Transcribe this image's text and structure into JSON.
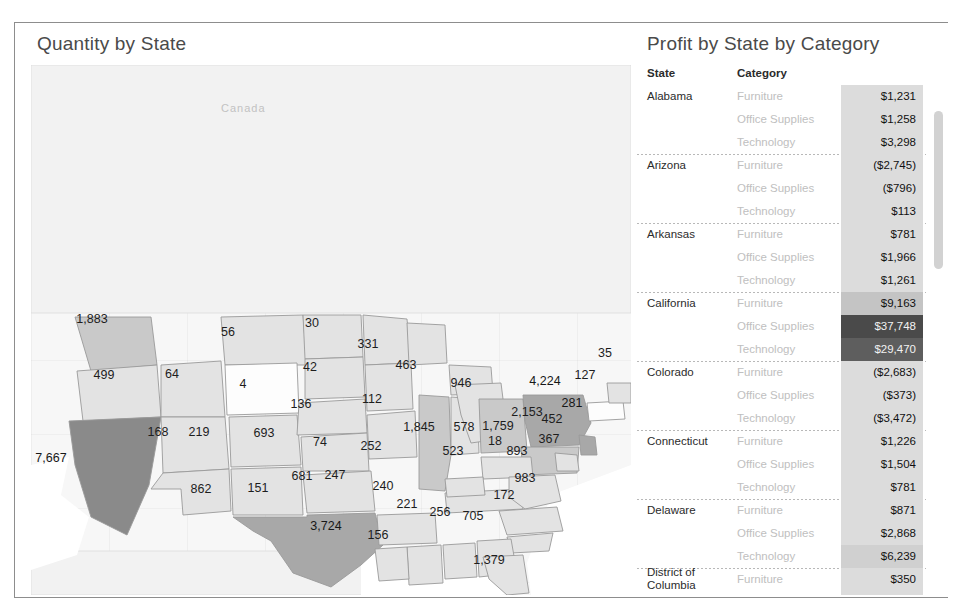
{
  "map_panel": {
    "title": "Quantity by State",
    "geo_labels": [
      {
        "name": "canada-label",
        "text": "Canada",
        "x": 190,
        "y": 75
      },
      {
        "name": "mexico-label",
        "text": "Mexico",
        "x": 280,
        "y": 585
      }
    ]
  },
  "table_panel": {
    "title": "Profit by State by Category",
    "headers": {
      "state": "State",
      "category": "Category"
    },
    "rows": [
      {
        "state": "Alabama",
        "category": "Furniture",
        "value": "$1,231",
        "shade": "light",
        "group_start": true,
        "first": true
      },
      {
        "state": "",
        "category": "Office Supplies",
        "value": "$1,258",
        "shade": "light"
      },
      {
        "state": "",
        "category": "Technology",
        "value": "$3,298",
        "shade": "light"
      },
      {
        "state": "Arizona",
        "category": "Furniture",
        "value": "($2,745)",
        "shade": "light",
        "group_start": true
      },
      {
        "state": "",
        "category": "Office Supplies",
        "value": "($796)",
        "shade": "light"
      },
      {
        "state": "",
        "category": "Technology",
        "value": "$113",
        "shade": "light"
      },
      {
        "state": "Arkansas",
        "category": "Furniture",
        "value": "$781",
        "shade": "light",
        "group_start": true
      },
      {
        "state": "",
        "category": "Office Supplies",
        "value": "$1,966",
        "shade": "light"
      },
      {
        "state": "",
        "category": "Technology",
        "value": "$1,261",
        "shade": "light"
      },
      {
        "state": "California",
        "category": "Furniture",
        "value": "$9,163",
        "shade": "mid",
        "group_start": true
      },
      {
        "state": "",
        "category": "Office Supplies",
        "value": "$37,748",
        "shade": "darkest"
      },
      {
        "state": "",
        "category": "Technology",
        "value": "$29,470",
        "shade": "dark"
      },
      {
        "state": "Colorado",
        "category": "Furniture",
        "value": "($2,683)",
        "shade": "light",
        "group_start": true
      },
      {
        "state": "",
        "category": "Office Supplies",
        "value": "($373)",
        "shade": "light"
      },
      {
        "state": "",
        "category": "Technology",
        "value": "($3,472)",
        "shade": "light"
      },
      {
        "state": "Connecticut",
        "category": "Furniture",
        "value": "$1,226",
        "shade": "light",
        "group_start": true
      },
      {
        "state": "",
        "category": "Office Supplies",
        "value": "$1,504",
        "shade": "light"
      },
      {
        "state": "",
        "category": "Technology",
        "value": "$781",
        "shade": "light"
      },
      {
        "state": "Delaware",
        "category": "Furniture",
        "value": "$871",
        "shade": "light",
        "group_start": true
      },
      {
        "state": "",
        "category": "Office Supplies",
        "value": "$2,868",
        "shade": "light"
      },
      {
        "state": "",
        "category": "Technology",
        "value": "$6,239",
        "shade": "light2"
      },
      {
        "state": "District of Columbia",
        "category": "Furniture",
        "value": "$350",
        "shade": "light",
        "group_start": true,
        "two_line": true
      },
      {
        "state": "",
        "category": "Office Supplies",
        "value": "$61",
        "shade": "light"
      },
      {
        "state": "",
        "category": "Technology",
        "value": "$649",
        "shade": "light"
      },
      {
        "state": "Florida",
        "category": "Furniture",
        "value": "($2,255)",
        "shade": "light",
        "group_start": true
      },
      {
        "state": "",
        "category": "Office Supplies",
        "value": "($1,675)",
        "shade": "light"
      }
    ],
    "scrollbar": {
      "name": "table-scrollbar"
    }
  },
  "chart_data": {
    "type": "map",
    "title": "Quantity by State",
    "measure": "Quantity",
    "encoding": "choropleth-gray",
    "regions": [
      {
        "state": "Washington",
        "value": "1,883",
        "x": 77,
        "y": 296,
        "shade": "m2"
      },
      {
        "state": "Oregon",
        "value": "499",
        "x": 89,
        "y": 352,
        "shade": "m1"
      },
      {
        "state": "Idaho",
        "value": "64",
        "x": 157,
        "y": 351,
        "shade": "m1"
      },
      {
        "state": "Montana",
        "value": "56",
        "x": 213,
        "y": 309,
        "shade": "m1"
      },
      {
        "state": "North Dakota",
        "value": "30",
        "x": 297,
        "y": 300,
        "shade": "m1"
      },
      {
        "state": "South Dakota",
        "value": "42",
        "x": 295,
        "y": 344,
        "shade": "m1"
      },
      {
        "state": "Minnesota",
        "value": "331",
        "x": 353,
        "y": 321,
        "shade": "m1"
      },
      {
        "state": "Wisconsin",
        "value": "463",
        "x": 391,
        "y": 342,
        "shade": "m1"
      },
      {
        "state": "Michigan",
        "value": "946",
        "x": 446,
        "y": 360,
        "shade": "m1"
      },
      {
        "state": "Wyoming",
        "value": "4",
        "x": 228,
        "y": 361,
        "shade": "m0"
      },
      {
        "state": "Nebraska",
        "value": "136",
        "x": 286,
        "y": 381,
        "shade": "m1"
      },
      {
        "state": "Iowa",
        "value": "112",
        "x": 357,
        "y": 376,
        "shade": "m1"
      },
      {
        "state": "Nevada",
        "value": "168",
        "x": 143,
        "y": 409,
        "shade": "m1"
      },
      {
        "state": "Utah",
        "value": "219",
        "x": 184,
        "y": 409,
        "shade": "m1"
      },
      {
        "state": "Colorado",
        "value": "693",
        "x": 249,
        "y": 410,
        "shade": "m1"
      },
      {
        "state": "Kansas",
        "value": "74",
        "x": 305,
        "y": 419,
        "shade": "m1"
      },
      {
        "state": "Missouri",
        "value": "252",
        "x": 356,
        "y": 423,
        "shade": "m1"
      },
      {
        "state": "California",
        "value": "7,667",
        "x": 36,
        "y": 435,
        "shade": "m4"
      },
      {
        "state": "Illinois",
        "value": "1,845",
        "x": 404,
        "y": 404,
        "shade": "m2"
      },
      {
        "state": "Indiana",
        "value": "578",
        "x": 449,
        "y": 404,
        "shade": "m1"
      },
      {
        "state": "Ohio",
        "value": "1,759",
        "x": 483,
        "y": 403,
        "shade": "m2"
      },
      {
        "state": "New York",
        "value": "4,224",
        "x": 530,
        "y": 358,
        "shade": "m3"
      },
      {
        "state": "Vermont",
        "value": "35",
        "x": 590,
        "y": 330,
        "shade": "m1"
      },
      {
        "state": "Massachusetts",
        "value": "127",
        "x": 570,
        "y": 352,
        "shade": "m0"
      },
      {
        "state": "Pennsylvania",
        "value": "2,153",
        "x": 512,
        "y": 389,
        "shade": "m2"
      },
      {
        "state": "New Jersey",
        "value": "281",
        "x": 557,
        "y": 380,
        "shade": "m3"
      },
      {
        "state": "Maryland",
        "value": "452",
        "x": 537,
        "y": 396,
        "shade": "m1"
      },
      {
        "state": "Kentucky",
        "value": "18",
        "x": 480,
        "y": 418,
        "shade": "m1"
      },
      {
        "state": "Virginia",
        "value": "893",
        "x": 502,
        "y": 428,
        "shade": "m1"
      },
      {
        "state": "Delaware",
        "value": "367",
        "x": 534,
        "y": 416,
        "shade": "m1"
      },
      {
        "state": "Tennessee",
        "value": "523",
        "x": 438,
        "y": 428,
        "shade": "m1"
      },
      {
        "state": "North Carolina",
        "value": "983",
        "x": 510,
        "y": 455,
        "shade": "m1"
      },
      {
        "state": "Arkansas",
        "value": "240",
        "x": 368,
        "y": 463,
        "shade": "m1"
      },
      {
        "state": "Mississippi",
        "value": "221",
        "x": 392,
        "y": 481,
        "shade": "m1"
      },
      {
        "state": "Alabama",
        "value": "256",
        "x": 425,
        "y": 489,
        "shade": "m1"
      },
      {
        "state": "Georgia",
        "value": "705",
        "x": 458,
        "y": 493,
        "shade": "m1"
      },
      {
        "state": "South Carolina",
        "value": "172",
        "x": 489,
        "y": 472,
        "shade": "m1"
      },
      {
        "state": "Louisiana",
        "value": "156",
        "x": 363,
        "y": 512,
        "shade": "m1"
      },
      {
        "state": "Florida",
        "value": "1,379",
        "x": 474,
        "y": 537,
        "shade": "m1"
      },
      {
        "state": "Oklahoma",
        "value": "247",
        "x": 320,
        "y": 452,
        "shade": "m1"
      },
      {
        "state": "New Mexico",
        "value": "151",
        "x": 243,
        "y": 465,
        "shade": "m1"
      },
      {
        "state": "Arizona",
        "value": "862",
        "x": 186,
        "y": 466,
        "shade": "m1"
      },
      {
        "state": "West Virginia",
        "value": "681",
        "x": 287,
        "y": 453,
        "shade": "m1"
      },
      {
        "state": "Texas",
        "value": "3,724",
        "x": 311,
        "y": 503,
        "shade": "m3"
      }
    ]
  }
}
